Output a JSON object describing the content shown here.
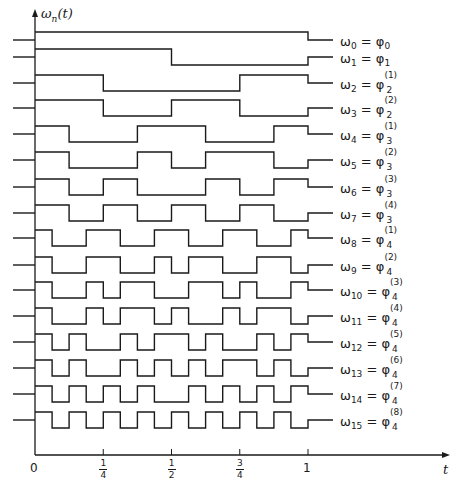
{
  "figure": {
    "y_axis_label": "ω",
    "y_axis_label_sub": "n",
    "y_axis_label_arg": "(t)",
    "x_axis_label": "t",
    "x_ticks": [
      {
        "value": 0,
        "label": "0"
      },
      {
        "value": 0.25,
        "num": "1",
        "den": "4"
      },
      {
        "value": 0.5,
        "num": "1",
        "den": "2"
      },
      {
        "value": 0.75,
        "num": "3",
        "den": "4"
      },
      {
        "value": 1,
        "label": "1"
      }
    ],
    "stroke_color": "#1a1a1a"
  },
  "chart_data": {
    "type": "line",
    "xlabel": "t",
    "ylabel": "ω_n(t)",
    "xlim": [
      0,
      1
    ],
    "x_ticks": [
      "0",
      "1/4",
      "1/2",
      "3/4",
      "1"
    ],
    "series": [
      {
        "name": "ω0 = φ0",
        "n": 0,
        "values": [
          1,
          1,
          1,
          1,
          1,
          1,
          1,
          1,
          1,
          1,
          1,
          1,
          1,
          1,
          1,
          1
        ]
      },
      {
        "name": "ω1 = φ1",
        "n": 1,
        "values": [
          1,
          1,
          1,
          1,
          1,
          1,
          1,
          1,
          -1,
          -1,
          -1,
          -1,
          -1,
          -1,
          -1,
          -1
        ]
      },
      {
        "name": "ω2 = φ2(1)",
        "n": 2,
        "values": [
          1,
          1,
          1,
          1,
          -1,
          -1,
          -1,
          -1,
          -1,
          -1,
          -1,
          -1,
          1,
          1,
          1,
          1
        ]
      },
      {
        "name": "ω3 = φ2(2)",
        "n": 3,
        "values": [
          1,
          1,
          1,
          1,
          -1,
          -1,
          -1,
          -1,
          1,
          1,
          1,
          1,
          -1,
          -1,
          -1,
          -1
        ]
      },
      {
        "name": "ω4 = φ3(1)",
        "n": 4,
        "values": [
          1,
          1,
          -1,
          -1,
          -1,
          -1,
          1,
          1,
          1,
          1,
          -1,
          -1,
          -1,
          -1,
          1,
          1
        ]
      },
      {
        "name": "ω5 = φ3(2)",
        "n": 5,
        "values": [
          1,
          1,
          -1,
          -1,
          -1,
          -1,
          1,
          1,
          -1,
          -1,
          1,
          1,
          1,
          1,
          -1,
          -1
        ]
      },
      {
        "name": "ω6 = φ3(3)",
        "n": 6,
        "values": [
          1,
          1,
          -1,
          -1,
          1,
          1,
          -1,
          -1,
          -1,
          -1,
          1,
          1,
          -1,
          -1,
          1,
          1
        ]
      },
      {
        "name": "ω7 = φ3(4)",
        "n": 7,
        "values": [
          1,
          1,
          -1,
          -1,
          1,
          1,
          -1,
          -1,
          1,
          1,
          -1,
          -1,
          1,
          1,
          -1,
          -1
        ]
      },
      {
        "name": "ω8 = φ4(1)",
        "n": 8,
        "values": [
          1,
          -1,
          -1,
          1,
          1,
          -1,
          -1,
          1,
          1,
          -1,
          -1,
          1,
          1,
          -1,
          -1,
          1
        ]
      },
      {
        "name": "ω9 = φ4(2)",
        "n": 9,
        "values": [
          1,
          -1,
          -1,
          1,
          1,
          -1,
          -1,
          1,
          -1,
          1,
          1,
          -1,
          -1,
          1,
          1,
          -1
        ]
      },
      {
        "name": "ω10 = φ4(3)",
        "n": 10,
        "values": [
          1,
          -1,
          -1,
          1,
          -1,
          1,
          1,
          -1,
          -1,
          1,
          1,
          -1,
          1,
          -1,
          -1,
          1
        ]
      },
      {
        "name": "ω11 = φ4(4)",
        "n": 11,
        "values": [
          1,
          -1,
          -1,
          1,
          -1,
          1,
          1,
          -1,
          1,
          -1,
          -1,
          1,
          -1,
          1,
          1,
          -1
        ]
      },
      {
        "name": "ω12 = φ4(5)",
        "n": 12,
        "values": [
          1,
          -1,
          1,
          -1,
          -1,
          1,
          -1,
          1,
          1,
          -1,
          1,
          -1,
          -1,
          1,
          -1,
          1
        ]
      },
      {
        "name": "ω13 = φ4(6)",
        "n": 13,
        "values": [
          1,
          -1,
          1,
          -1,
          -1,
          1,
          -1,
          1,
          -1,
          1,
          -1,
          1,
          1,
          -1,
          1,
          -1
        ]
      },
      {
        "name": "ω14 = φ4(7)",
        "n": 14,
        "values": [
          1,
          -1,
          1,
          -1,
          1,
          -1,
          1,
          -1,
          -1,
          1,
          -1,
          1,
          -1,
          1,
          -1,
          1
        ]
      },
      {
        "name": "ω15 = φ4(8)",
        "n": 15,
        "values": [
          1,
          -1,
          1,
          -1,
          1,
          -1,
          1,
          -1,
          1,
          -1,
          1,
          -1,
          1,
          -1,
          1,
          -1
        ]
      }
    ]
  },
  "labels": [
    {
      "w": "ω",
      "wsub": "0",
      "phi": "φ",
      "phisub": "0",
      "sup": ""
    },
    {
      "w": "ω",
      "wsub": "1",
      "phi": "φ",
      "phisub": "1",
      "sup": ""
    },
    {
      "w": "ω",
      "wsub": "2",
      "phi": "φ",
      "phisub": "2",
      "sup": "(1)"
    },
    {
      "w": "ω",
      "wsub": "3",
      "phi": "φ",
      "phisub": "2",
      "sup": "(2)"
    },
    {
      "w": "ω",
      "wsub": "4",
      "phi": "φ",
      "phisub": "3",
      "sup": "(1)"
    },
    {
      "w": "ω",
      "wsub": "5",
      "phi": "φ",
      "phisub": "3",
      "sup": "(2)"
    },
    {
      "w": "ω",
      "wsub": "6",
      "phi": "φ",
      "phisub": "3",
      "sup": "(3)"
    },
    {
      "w": "ω",
      "wsub": "7",
      "phi": "φ",
      "phisub": "3",
      "sup": "(4)"
    },
    {
      "w": "ω",
      "wsub": "8",
      "phi": "φ",
      "phisub": "4",
      "sup": "(1)"
    },
    {
      "w": "ω",
      "wsub": "9",
      "phi": "φ",
      "phisub": "4",
      "sup": "(2)"
    },
    {
      "w": "ω",
      "wsub": "10",
      "phi": "φ",
      "phisub": "4",
      "sup": "(3)"
    },
    {
      "w": "ω",
      "wsub": "11",
      "phi": "φ",
      "phisub": "4",
      "sup": "(4)"
    },
    {
      "w": "ω",
      "wsub": "12",
      "phi": "φ",
      "phisub": "4",
      "sup": "(5)"
    },
    {
      "w": "ω",
      "wsub": "13",
      "phi": "φ",
      "phisub": "4",
      "sup": "(6)"
    },
    {
      "w": "ω",
      "wsub": "14",
      "phi": "φ",
      "phisub": "4",
      "sup": "(7)"
    },
    {
      "w": "ω",
      "wsub": "15",
      "phi": "φ",
      "phisub": "4",
      "sup": "(8)"
    }
  ]
}
